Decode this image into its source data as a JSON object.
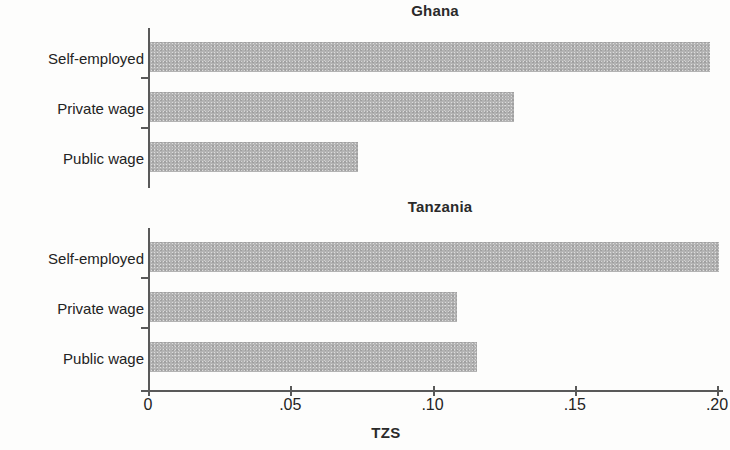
{
  "figure": {
    "background_color": "#fdfdfc",
    "bar_color": "#b3b3b3",
    "axis_color": "#595959",
    "text_color": "#232323"
  },
  "x_axis": {
    "title": "TZS",
    "tick_labels": [
      "0",
      ".05",
      ".10",
      ".15",
      ".20"
    ],
    "tick_values": [
      0,
      0.05,
      0.1,
      0.15,
      0.2
    ]
  },
  "panels": [
    {
      "title": "Ghana",
      "categories": [
        "Self-employed",
        "Private wage",
        "Public wage"
      ],
      "values": [
        0.197,
        0.128,
        0.073
      ]
    },
    {
      "title": "Tanzania",
      "categories": [
        "Self-employed",
        "Private wage",
        "Public wage"
      ],
      "values": [
        0.2,
        0.108,
        0.115
      ]
    }
  ],
  "chart_data": {
    "type": "bar",
    "orientation": "horizontal",
    "title": "",
    "xlabel": "TZS",
    "ylabel": "",
    "xlim": [
      0,
      0.2
    ],
    "xticks": [
      0,
      0.05,
      0.1,
      0.15,
      0.2
    ],
    "xtick_labels": [
      "0",
      ".05",
      ".10",
      ".15",
      ".20"
    ],
    "grid": false,
    "legend": "none",
    "panels": [
      {
        "title": "Ghana",
        "categories": [
          "Self-employed",
          "Private wage",
          "Public wage"
        ],
        "values": [
          0.197,
          0.128,
          0.073
        ]
      },
      {
        "title": "Tanzania",
        "categories": [
          "Self-employed",
          "Private wage",
          "Public wage"
        ],
        "values": [
          0.2,
          0.108,
          0.115
        ]
      }
    ]
  }
}
